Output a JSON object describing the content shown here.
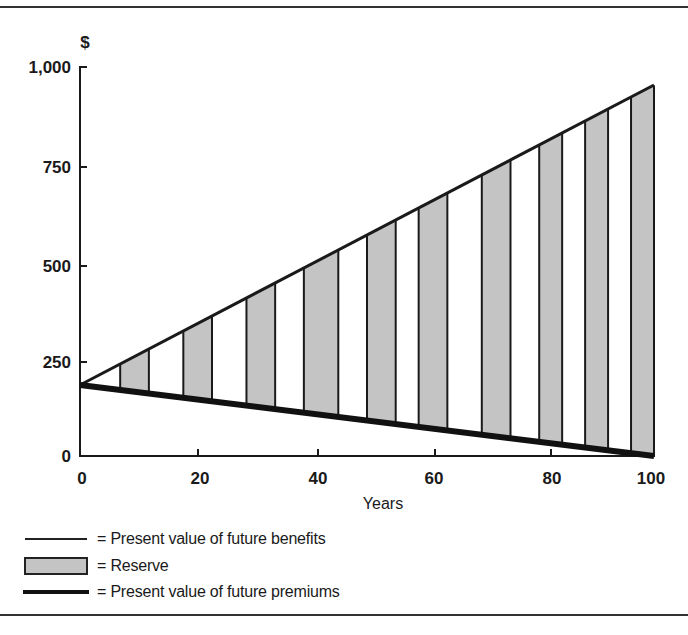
{
  "chart_data": {
    "type": "area",
    "title": "",
    "xlabel": "Years",
    "ylabel": "$",
    "xlim": [
      0,
      100
    ],
    "ylim": [
      0,
      1000
    ],
    "x_ticks": [
      0,
      20,
      40,
      60,
      80,
      100
    ],
    "y_ticks": [
      0,
      250,
      500,
      750,
      1000
    ],
    "x_tick_labels": [
      "0",
      "20",
      "40",
      "60",
      "80",
      "100"
    ],
    "y_tick_labels": [
      "0",
      "250",
      "500",
      "750",
      "1,000"
    ],
    "grid": false,
    "legend_position": "bottom-left",
    "series": [
      {
        "name": "Present value of future benefits",
        "style": "thin line",
        "x": [
          0,
          100
        ],
        "values": [
          182,
          950
        ]
      },
      {
        "name": "Present value of future premiums",
        "style": "thick line",
        "x": [
          0,
          100
        ],
        "values": [
          182,
          0
        ]
      },
      {
        "name": "Reserve",
        "style": "shaded vertical bands between the two lines",
        "bands": [
          [
            7,
            12
          ],
          [
            18,
            23
          ],
          [
            29,
            34
          ],
          [
            39,
            45
          ],
          [
            50,
            55
          ],
          [
            59,
            64
          ],
          [
            70,
            75
          ],
          [
            80,
            84
          ],
          [
            88,
            92
          ],
          [
            96,
            100
          ]
        ]
      }
    ],
    "annotations": []
  },
  "axes": {
    "y_unit": "$",
    "x_title": "Years",
    "y_ticks": [
      "1,000",
      "750",
      "500",
      "250",
      "0"
    ],
    "x_ticks": [
      "0",
      "20",
      "40",
      "60",
      "80",
      "100"
    ]
  },
  "legend": {
    "items": [
      {
        "label": "= Present value of future benefits"
      },
      {
        "label": "= Reserve"
      },
      {
        "label": "= Present value of future premiums"
      }
    ]
  },
  "colors": {
    "reserve_fill": "#c4c4c4",
    "line": "#1a1a1a"
  }
}
